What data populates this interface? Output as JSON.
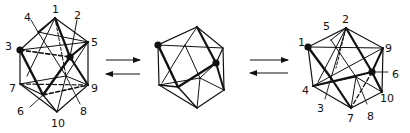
{
  "figure": {
    "ink_color": "#111111",
    "background": "#ffffff"
  },
  "left_polyhedron": {
    "labels": [
      "1",
      "2",
      "3",
      "4",
      "5",
      "6",
      "7",
      "8",
      "9",
      "10"
    ],
    "marked_vertices": [
      "3",
      "2"
    ]
  },
  "middle_polyhedron": {
    "labels": [],
    "marked_vertices_count": 2
  },
  "right_polyhedron": {
    "labels": [
      "1",
      "2",
      "3",
      "4",
      "5",
      "6",
      "7",
      "8",
      "9",
      "10"
    ],
    "marked_vertices": [
      "1",
      "6"
    ]
  },
  "arrows": [
    {
      "position": "left",
      "forward": "right",
      "reverse": "left"
    },
    {
      "position": "right",
      "forward": "right",
      "reverse": "left"
    }
  ]
}
